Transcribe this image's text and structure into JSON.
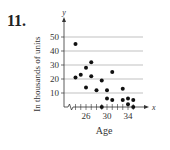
{
  "problem_number": "11.",
  "chart_data": {
    "type": "scatter",
    "title": "",
    "xlabel": "Age",
    "ylabel": "In thousands of units",
    "x_axis_symbol": "x",
    "y_axis_symbol": "y",
    "x_ticks": [
      26,
      30,
      34
    ],
    "y_ticks": [
      10,
      20,
      30,
      40,
      50
    ],
    "grid": "horizontal",
    "xlim": [
      23,
      36
    ],
    "ylim": [
      0,
      55
    ],
    "axis_break": true,
    "points": [
      {
        "x": 24,
        "y": 45
      },
      {
        "x": 24,
        "y": 21
      },
      {
        "x": 25,
        "y": 23
      },
      {
        "x": 26,
        "y": 28
      },
      {
        "x": 26,
        "y": 14
      },
      {
        "x": 27,
        "y": 32
      },
      {
        "x": 27,
        "y": 22
      },
      {
        "x": 28,
        "y": 12
      },
      {
        "x": 29,
        "y": 19
      },
      {
        "x": 29,
        "y": 0
      },
      {
        "x": 30,
        "y": 12
      },
      {
        "x": 30,
        "y": 6
      },
      {
        "x": 31,
        "y": 25
      },
      {
        "x": 31,
        "y": 5
      },
      {
        "x": 33,
        "y": 13
      },
      {
        "x": 33,
        "y": 5
      },
      {
        "x": 34,
        "y": 6
      },
      {
        "x": 34,
        "y": 2
      },
      {
        "x": 35,
        "y": 5
      },
      {
        "x": 35,
        "y": 0
      }
    ]
  }
}
